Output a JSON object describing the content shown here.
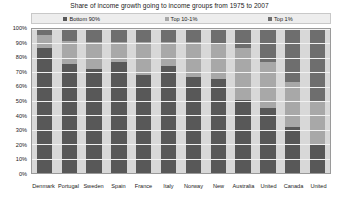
{
  "chart_data": {
    "type": "bar",
    "subtype": "stacked-percent-column",
    "title": "Share of income growth going to income groups from 1975 to 2007",
    "xlabel": "",
    "ylabel": "",
    "ylim": [
      0,
      100
    ],
    "ytick_labels": [
      "100%",
      "90%",
      "80%",
      "70%",
      "60%",
      "50%",
      "40%",
      "30%",
      "20%",
      "10%",
      "0%"
    ],
    "ytick_values": [
      100,
      90,
      80,
      70,
      60,
      50,
      40,
      30,
      20,
      10,
      0
    ],
    "grid": true,
    "legend_position": "top",
    "categories": [
      "Denmark",
      "Portugal",
      "Sweden",
      "Spain",
      "France",
      "Italy",
      "Norway",
      "New",
      "Australia",
      "United",
      "Canada",
      "United"
    ],
    "series": [
      {
        "name": "Bottom 90%",
        "color": "#585858",
        "values": [
          87,
          76,
          72,
          77,
          68,
          74,
          67,
          65,
          51,
          45,
          32,
          20
        ]
      },
      {
        "name": "Top 10-1%",
        "color": "#a8a8a8",
        "values": [
          9,
          16,
          19,
          14,
          23,
          17,
          24,
          25,
          36,
          32,
          31,
          29
        ]
      },
      {
        "name": "Top 1%",
        "color": "#6e6e6e",
        "values": [
          4,
          8,
          9,
          9,
          9,
          9,
          9,
          10,
          13,
          23,
          37,
          51
        ]
      }
    ]
  },
  "legend": {
    "items": [
      {
        "label": "Bottom 90%"
      },
      {
        "label": "Top 10-1%"
      },
      {
        "label": "Top 1%"
      }
    ]
  },
  "colors": {
    "bottom90": "#585858",
    "top10_1": "#a8a8a8",
    "top1": "#6e6e6e",
    "plot_background": "#d8d8d8",
    "legend_background": "#ededed",
    "gridline": "#f2f2f2"
  }
}
